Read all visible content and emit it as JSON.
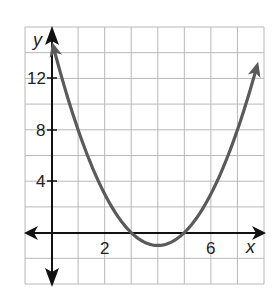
{
  "chart_data": {
    "type": "line",
    "title": "",
    "xlabel": "x",
    "ylabel": "y",
    "xlim": [
      -1,
      8
    ],
    "ylim": [
      -4,
      16
    ],
    "grid": true,
    "grid_step": {
      "x": 1,
      "y": 2
    },
    "x_ticks": [
      {
        "value": 2,
        "label": "2"
      },
      {
        "value": 6,
        "label": "6"
      }
    ],
    "y_ticks": [
      {
        "value": 4,
        "label": "4"
      },
      {
        "value": 8,
        "label": "8"
      },
      {
        "value": 12,
        "label": "12"
      }
    ],
    "series": [
      {
        "name": "parabola",
        "equation": "y = (x - 3)(x - 5)",
        "x": [
          0,
          0.5,
          1,
          1.5,
          2,
          2.5,
          3,
          3.5,
          4,
          4.5,
          5,
          5.5,
          6,
          6.5,
          7,
          7.5,
          7.8
        ],
        "values": [
          15,
          11.25,
          8,
          5.25,
          3,
          1.25,
          0,
          -0.75,
          -1,
          -0.75,
          0,
          1.25,
          3,
          5.25,
          8,
          11.25,
          13.44
        ],
        "color": "#5a5a5a",
        "arrows_at_ends": true
      }
    ],
    "features": {
      "x_intercepts": [
        3,
        5
      ],
      "vertex": [
        4,
        -1
      ],
      "y_intercept": 15
    },
    "legend": null
  },
  "labels": {
    "x_axis": "x",
    "y_axis": "y",
    "tick_x_2": "2",
    "tick_x_6": "6",
    "tick_y_4": "4",
    "tick_y_8": "8",
    "tick_y_12": "12"
  },
  "colors": {
    "grid": "#b8b8b8",
    "axes": "#111111",
    "curve": "#5a5a5a"
  }
}
